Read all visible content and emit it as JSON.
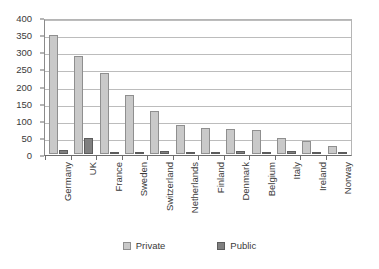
{
  "chart_data": {
    "type": "bar",
    "title": "",
    "subtitle": "",
    "xlabel": "",
    "ylabel": "",
    "ylim": [
      0,
      400
    ],
    "ytick_step": 50,
    "yticks": [
      0,
      50,
      100,
      150,
      200,
      250,
      300,
      350,
      400
    ],
    "ytick_labels": [
      "0",
      "50",
      "100",
      "150",
      "200",
      "250",
      "300",
      "350",
      "400"
    ],
    "grid": "horizontal",
    "legend_position": "bottom",
    "orientation": "vertical",
    "categories": [
      "Germany",
      "UK",
      "France",
      "Sweden",
      "Switzerland",
      "Netherlands",
      "Finland",
      "Denmark",
      "Belgium",
      "Italy",
      "Ireland",
      "Norway"
    ],
    "series": [
      {
        "name": "Private",
        "color": "#c9c9c9",
        "values": [
          348,
          286,
          237,
          171,
          126,
          86,
          77,
          74,
          71,
          48,
          38,
          22
        ]
      },
      {
        "name": "Public",
        "color": "#808080",
        "values": [
          12,
          48,
          7,
          5,
          8,
          5,
          1,
          9,
          1,
          9,
          7,
          7
        ]
      }
    ]
  },
  "legend": {
    "items": [
      {
        "label": "Private",
        "swatch": "private"
      },
      {
        "label": "Public",
        "swatch": "public"
      }
    ]
  },
  "colors": {
    "private": "#c9c9c9",
    "public": "#808080",
    "gridline": "#bcbcbc",
    "axis": "#6d6d6d",
    "text": "#3a3a3a",
    "background": "#ffffff"
  }
}
